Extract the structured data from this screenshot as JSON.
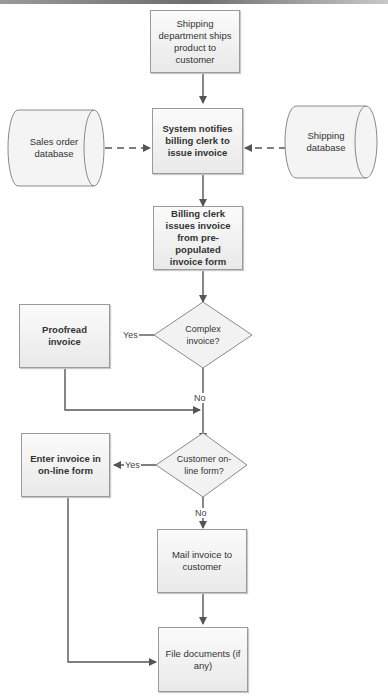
{
  "diagram": {
    "type": "flowchart",
    "title": "",
    "nodes": {
      "ship": {
        "text": "Shipping department ships product to customer",
        "shape": "process"
      },
      "sales_db": {
        "text": "Sales order database",
        "shape": "database"
      },
      "notify": {
        "text": "System notifies billing clerk to issue invoice",
        "shape": "process",
        "bold": true
      },
      "shipping_db": {
        "text": "Shipping database",
        "shape": "database"
      },
      "issue": {
        "text": "Billing clerk issues invoice from pre-populated invoice form",
        "shape": "process",
        "bold": true
      },
      "complex": {
        "text": "Complex invoice?",
        "shape": "decision"
      },
      "proofread": {
        "text": "Proofread invoice",
        "shape": "process",
        "bold": true
      },
      "online": {
        "text": "Customer on-line form?",
        "shape": "decision"
      },
      "enter": {
        "text": "Enter invoice in on-line form",
        "shape": "process",
        "bold": true
      },
      "mail": {
        "text": "Mail invoice to customer",
        "shape": "process"
      },
      "file": {
        "text": "File documents (if any)",
        "shape": "process"
      }
    },
    "edge_labels": {
      "complex_yes": "Yes",
      "complex_no": "No",
      "online_yes": "Yes",
      "online_no": "No"
    },
    "edges": [
      {
        "from": "ship",
        "to": "notify",
        "style": "solid"
      },
      {
        "from": "sales_db",
        "to": "notify",
        "style": "dashed"
      },
      {
        "from": "shipping_db",
        "to": "notify",
        "style": "dashed"
      },
      {
        "from": "notify",
        "to": "issue",
        "style": "solid"
      },
      {
        "from": "issue",
        "to": "complex",
        "style": "solid"
      },
      {
        "from": "complex",
        "to": "proofread",
        "label": "Yes"
      },
      {
        "from": "complex",
        "to": "online",
        "label": "No"
      },
      {
        "from": "proofread",
        "to": "online"
      },
      {
        "from": "online",
        "to": "enter",
        "label": "Yes"
      },
      {
        "from": "online",
        "to": "mail",
        "label": "No"
      },
      {
        "from": "mail",
        "to": "file"
      },
      {
        "from": "enter",
        "to": "file"
      }
    ]
  }
}
